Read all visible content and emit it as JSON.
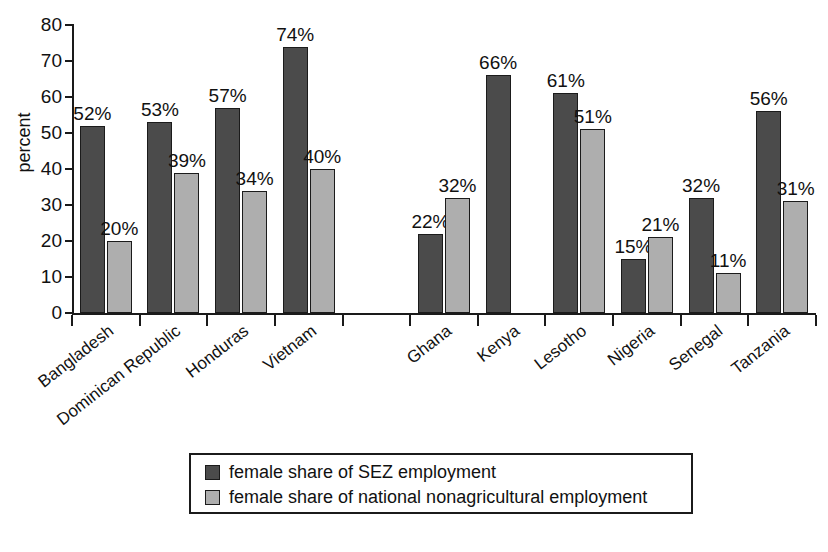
{
  "chart_data": {
    "type": "bar",
    "title": "",
    "xlabel": "",
    "ylabel": "percent",
    "ylim": [
      0,
      80
    ],
    "ytick_step": 10,
    "yticks": [
      0,
      10,
      20,
      30,
      40,
      50,
      60,
      70,
      80
    ],
    "ytick_labels": [
      "0",
      "10",
      "20",
      "30",
      "40",
      "50",
      "60",
      "70",
      "80"
    ],
    "grid": false,
    "value_label_suffix": "%",
    "legend_position": "bottom-center",
    "group_gap_after_index": 3,
    "categories": [
      "Bangladesh",
      "Dominican Republic",
      "Honduras",
      "Vietnam",
      "Ghana",
      "Kenya",
      "Lesotho",
      "Nigeria",
      "Senegal",
      "Tanzania"
    ],
    "series": [
      {
        "name": "female share of SEZ employment",
        "color": "#4b4b4b",
        "values": [
          52,
          53,
          57,
          74,
          22,
          66,
          61,
          15,
          32,
          56
        ],
        "labels": [
          "52%",
          "53%",
          "57%",
          "74%",
          "22%",
          "66%",
          "61%",
          "15%",
          "32%",
          "56%"
        ]
      },
      {
        "name": "female share of national nonagricultural employment",
        "color": "#aeaeae",
        "values": [
          20,
          39,
          34,
          40,
          32,
          null,
          51,
          21,
          11,
          31
        ],
        "labels": [
          "20%",
          "39%",
          "34%",
          "40%",
          "32%",
          "",
          "51%",
          "21%",
          "11%",
          "31%"
        ]
      }
    ]
  },
  "axis": {
    "y_title": "percent"
  },
  "legend": {
    "items": [
      {
        "label": "female share of SEZ employment",
        "swatch": "dark"
      },
      {
        "label": "female share of national nonagricultural employment",
        "swatch": "light"
      }
    ]
  }
}
